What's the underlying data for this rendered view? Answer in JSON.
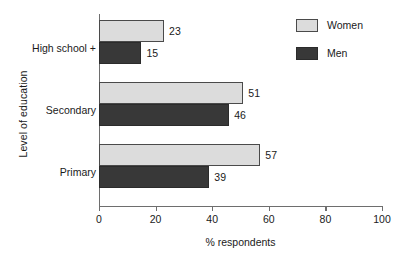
{
  "chart_data": {
    "type": "bar",
    "orientation": "horizontal",
    "title": "",
    "xlabel": "% respondents",
    "ylabel": "Level of education",
    "xlim": [
      0,
      100
    ],
    "xticks": [
      0,
      20,
      40,
      60,
      80,
      100
    ],
    "xtick_labels": [
      "0",
      "20",
      "40",
      "60",
      "80",
      "100"
    ],
    "grid": false,
    "legend_position": "top-right",
    "categories": [
      "High school +",
      "Secondary",
      "Primary"
    ],
    "series": [
      {
        "name": "Women",
        "color": "#dcdcdc",
        "values": [
          23,
          51,
          57
        ],
        "value_labels": [
          "23",
          "51",
          "57"
        ]
      },
      {
        "name": "Men",
        "color": "#383838",
        "values": [
          15,
          46,
          39
        ],
        "value_labels": [
          "15",
          "46",
          "39"
        ]
      }
    ]
  },
  "legend": {
    "items": [
      {
        "label": "Women",
        "swatch": "women"
      },
      {
        "label": "Men",
        "swatch": "men"
      }
    ]
  },
  "colors": {
    "women": "#dcdcdc",
    "men": "#383838",
    "axis": "#6e6e6e",
    "text": "#1a1a1a",
    "background": "#ffffff"
  }
}
